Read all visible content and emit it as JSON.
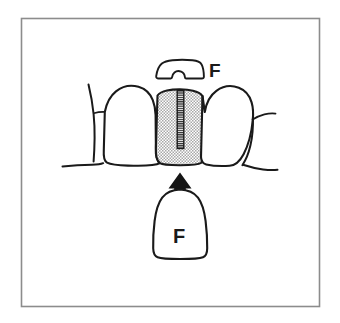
{
  "figure": {
    "frame": {
      "stroke_color": "#8c8c8c",
      "x": 21,
      "y": 18,
      "width": 299,
      "height": 289
    },
    "colors": {
      "ink": "#1a1a1a",
      "background": "#ffffff",
      "stipple": "#9a9a9a",
      "arrow_fill": "#151515",
      "frame": "#8c8c8c"
    }
  },
  "labels": {
    "bracket_label": "F",
    "appliance_label": "F"
  },
  "parts": {
    "bracket": {
      "name": "bracket-appliance",
      "label": "F",
      "notch": "omega-slot"
    },
    "center_tooth": {
      "name": "central-incisor-shaded",
      "shading": "stipple",
      "slot": "vertical-hatched-slot"
    },
    "left_tooth": {
      "name": "left-incisor"
    },
    "left_partial_tooth": {
      "name": "left-partial-tooth"
    },
    "right_tooth": {
      "name": "right-incisor"
    },
    "right_partial_tooth": {
      "name": "right-partial-tooth"
    },
    "gum_line": {
      "name": "gingival-margin"
    },
    "force_arrow": {
      "name": "upward-force-arrow",
      "direction": "up",
      "shaft": "striped"
    },
    "lower_appliance": {
      "name": "lower-dome-appliance",
      "label": "F"
    }
  }
}
